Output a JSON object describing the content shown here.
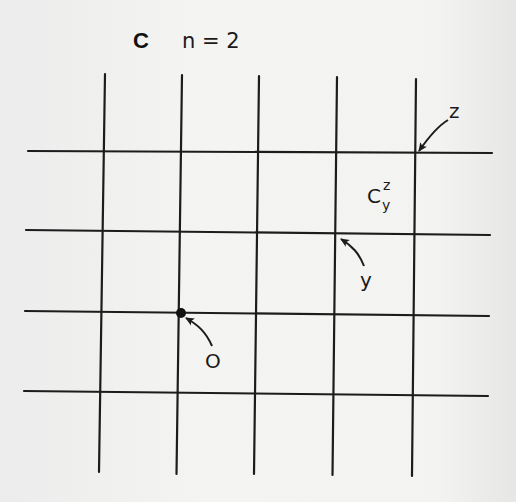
{
  "figure": {
    "panel_label": "C",
    "caption": "n = 2",
    "grid": {
      "columns": 5,
      "rows": 4
    },
    "labels": {
      "origin": "O",
      "point_y": "y",
      "point_z": "z",
      "cell_symbol": "C",
      "cell_superscript": "z",
      "cell_subscript": "y"
    },
    "marked_vertex": {
      "name": "O",
      "column": 2,
      "row": 3
    },
    "annotated_vertices": [
      {
        "name": "y",
        "column": 4,
        "row": 2
      },
      {
        "name": "z",
        "column": 5,
        "row": 1
      }
    ],
    "colors": {
      "ink": "#1c1c1c",
      "paper": "#f3f3f1"
    }
  }
}
